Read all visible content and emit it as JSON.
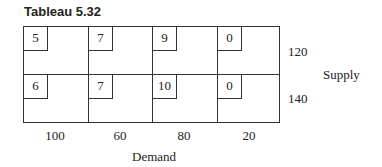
{
  "title": "Tableau 5.32",
  "costs": [
    [
      "5",
      "7",
      "9",
      "0"
    ],
    [
      "6",
      "7",
      "10",
      "0"
    ]
  ],
  "supply": [
    "120",
    "140"
  ],
  "supply_label": "Supply",
  "demand": [
    "100",
    "60",
    "80",
    "20"
  ],
  "demand_label": "Demand"
}
